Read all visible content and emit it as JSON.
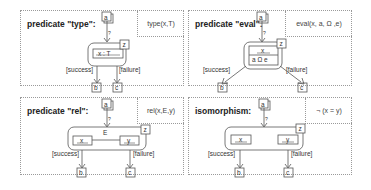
{
  "panels": [
    {
      "id": "type",
      "title": "predicate \"type\":",
      "formula": "type(x,T)",
      "input_node": "a",
      "output_success_node": "b",
      "output_failure_node": "c",
      "corner_node": "z",
      "inner_label": "x : T",
      "success_label": "[success]",
      "failure_label": "[failure]",
      "edge_label": "?"
    },
    {
      "id": "eval",
      "title": "predicate \"eval\":",
      "formula": "eval(x, a, Ω ,e)",
      "input_node": "a",
      "output_success_node": "b",
      "output_failure_node": "c",
      "corner_node": "z",
      "inner_label_top": "x",
      "inner_label_bottom": "a Ω e",
      "success_label": "[success]",
      "failure_label": "[failure]",
      "edge_label": "?"
    },
    {
      "id": "rel",
      "title": "predicate \"rel\":",
      "formula": "rel(x,E,y)",
      "input_node": "a",
      "output_success_node": "b",
      "output_failure_node": "c",
      "corner_node": "z",
      "edge_name": "E",
      "left_label": "x",
      "right_label": "y",
      "success_label": "[success]",
      "failure_label": "[failure]",
      "edge_label": "?"
    },
    {
      "id": "iso",
      "title": "isomorphism:",
      "formula": "¬ (x = y)",
      "input_node": "a",
      "output_success_node": "b",
      "output_failure_node": "c",
      "corner_node": "z",
      "left_label": "x",
      "right_label": "y",
      "success_label": "[success]",
      "failure_label": "[failure]",
      "edge_label": "?"
    }
  ]
}
